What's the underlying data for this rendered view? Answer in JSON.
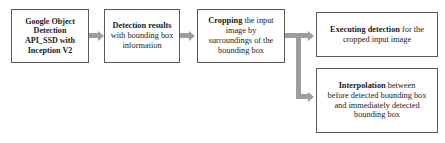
{
  "diagram": {
    "colors": {
      "box_border": "#5a5a5a",
      "box_fill": "#ffffff",
      "connector": "#9d9d9d",
      "text": "#1a1a1a",
      "background": "#ffffff"
    },
    "nodes": [
      {
        "id": "detect-api",
        "lines": [
          {
            "text": "Google Object",
            "bold": true
          },
          {
            "text": "Detection",
            "bold": true
          },
          {
            "text": "API_SSD with",
            "bold": true
          },
          {
            "text": "Inception V2",
            "bold": true
          }
        ]
      },
      {
        "id": "detect-res",
        "lines": [
          {
            "text": "Detection results",
            "bold": true
          },
          {
            "text": "with bounding box",
            "bold": false
          },
          {
            "text": "information",
            "bold": false
          }
        ]
      },
      {
        "id": "cropping",
        "lines": [
          {
            "text": "Cropping",
            "bold": true,
            "tail": " the input"
          },
          {
            "text": "image by",
            "bold": false
          },
          {
            "text": "surroundings of the",
            "bold": false
          },
          {
            "text": "bounding box",
            "bold": false
          }
        ]
      },
      {
        "id": "executing",
        "lines": [
          {
            "text": "Executing detection",
            "bold": true,
            "tail": " for the"
          },
          {
            "text": "cropped input image",
            "bold": false
          }
        ]
      },
      {
        "id": "interpolate",
        "lines": [
          {
            "text": "Interpolation",
            "bold": true,
            "tail": " between"
          },
          {
            "text": "before detected bounding box",
            "bold": false
          },
          {
            "text": "and immediately detected",
            "bold": false
          },
          {
            "text": "bounding box",
            "bold": false
          }
        ]
      }
    ],
    "connectors": [
      {
        "id": "conn-1",
        "from": "detect-api",
        "to": "detect-res",
        "shape": "straight-arrow-right"
      },
      {
        "id": "conn-2",
        "from": "detect-res",
        "to": "cropping",
        "shape": "straight-arrow-right"
      },
      {
        "id": "conn-3",
        "from": "cropping",
        "to": "executing",
        "shape": "branch-arrow-up-right"
      },
      {
        "id": "conn-4",
        "from": "cropping",
        "to": "interpolate",
        "shape": "branch-arrow-down-right"
      }
    ]
  },
  "nodes_text": {
    "detect_api": {
      "l1": "Google Object",
      "l2": "Detection",
      "l3": "API_SSD with",
      "l4": "Inception V2"
    },
    "detect_res": {
      "l1": "Detection results",
      "l2": "with bounding box",
      "l3": "information"
    },
    "cropping": {
      "l1_bold": "Cropping",
      "l1_rest": " the input",
      "l2": "image by",
      "l3": "surroundings of the",
      "l4": "bounding box"
    },
    "executing": {
      "l1_bold": "Executing detection",
      "l1_rest": " for the",
      "l2": "cropped input image"
    },
    "interpolate": {
      "l1_bold": "Interpolation",
      "l1_rest": " between",
      "l2": "before detected bounding box",
      "l3": "and immediately detected",
      "l4": "bounding box"
    }
  }
}
